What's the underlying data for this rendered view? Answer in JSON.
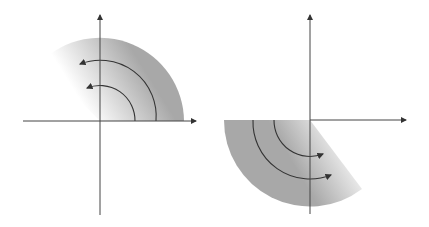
{
  "diagram": {
    "colors": {
      "axis": "#444444",
      "sector": "#a8a8a8",
      "arrow": "#333333",
      "background": "#ffffff"
    },
    "panels": [
      {
        "name": "left",
        "sector": "upper quadrant (second-to-first, fading toward upper-left)",
        "arrows": "counter-clockwise",
        "arrow_count": 2
      },
      {
        "name": "right",
        "sector": "lower quadrant (third-to-fourth, fading toward lower-right)",
        "arrows": "counter-clockwise",
        "arrow_count": 2
      }
    ]
  }
}
